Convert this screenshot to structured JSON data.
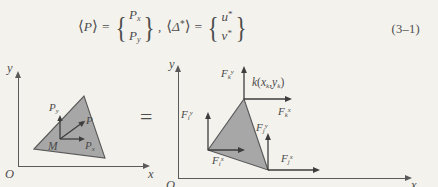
{
  "equation": {
    "lhs_vector_symbol": "P",
    "lhs_components": [
      "P",
      "P"
    ],
    "lhs_component_subs": [
      "x",
      "y"
    ],
    "rhs_vector_symbol": "Δ",
    "rhs_vector_star": "*",
    "rhs_components": [
      "u",
      "v"
    ],
    "rhs_component_stars": [
      "*",
      "*"
    ],
    "equals": "=",
    "comma": ",",
    "number": "(3–1)"
  },
  "figure": {
    "equals_sign": "=",
    "left_panel": {
      "y_axis_label": "y",
      "x_axis_label": "x",
      "origin_label": "O",
      "node_label": "M",
      "vectors": [
        {
          "name": "P-y-component",
          "label_base": "P",
          "label_sub": "y"
        },
        {
          "name": "P-resultant",
          "label_base": "P",
          "label_sub": ""
        },
        {
          "name": "P-x-component",
          "label_base": "P",
          "label_sub": "x"
        }
      ]
    },
    "right_panel": {
      "y_axis_label": "y",
      "x_axis_label": "x",
      "origin_label": "O",
      "node_k_label": {
        "base": "k",
        "open": "(",
        "x": "x",
        "xsub": "k",
        "comma": ",",
        "y": "y",
        "ysub": "k",
        "close": ")"
      },
      "forces": [
        {
          "name": "force-k-y",
          "base": "F",
          "sub": "k",
          "sup": "y"
        },
        {
          "name": "force-k-x",
          "base": "F",
          "sub": "k",
          "sup": "x"
        },
        {
          "name": "force-i-y",
          "base": "F",
          "sub": "i",
          "sup": "y"
        },
        {
          "name": "force-i-x",
          "base": "F",
          "sub": "i",
          "sup": "x"
        },
        {
          "name": "force-j-y",
          "base": "F",
          "sub": "j",
          "sup": "y"
        },
        {
          "name": "force-j-x",
          "base": "F",
          "sub": "j",
          "sup": "x"
        }
      ]
    }
  },
  "colors": {
    "page_background": "#f4f2ed",
    "ink": "#4d4d4d",
    "triangle_fill": "#a8a8a8",
    "triangle_stroke": "#555555"
  }
}
